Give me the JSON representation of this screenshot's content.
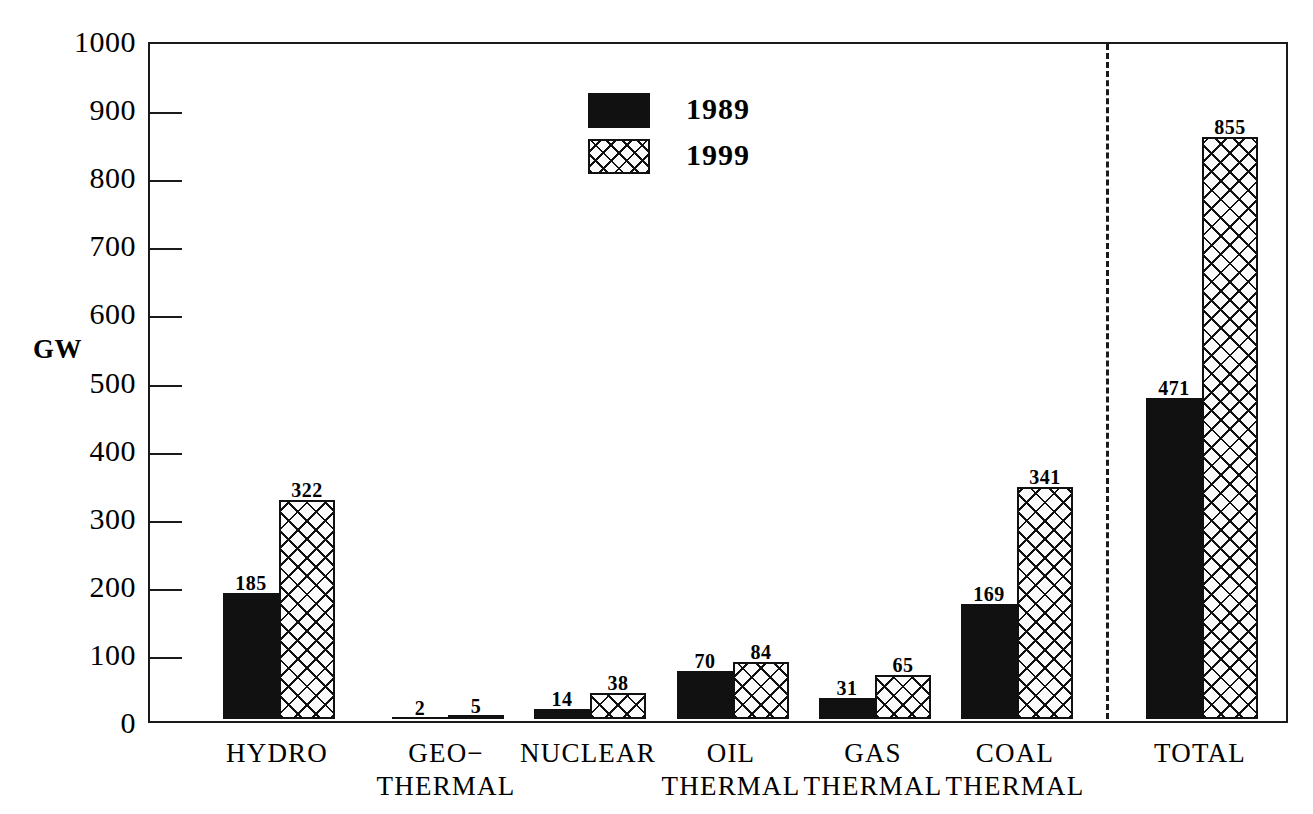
{
  "chart_data": {
    "type": "bar",
    "title": "",
    "xlabel": "",
    "ylabel": "GW",
    "ylim": [
      0,
      1000
    ],
    "ytick_values": [
      0,
      100,
      200,
      300,
      400,
      500,
      600,
      700,
      800,
      900,
      1000
    ],
    "ytick_labels": [
      "0",
      "100",
      "200",
      "300",
      "400",
      "500",
      "600",
      "700",
      "800",
      "900",
      "1000"
    ],
    "grid": false,
    "legend_position": "top-center",
    "categories": [
      "HYDRO",
      "GEO-\nTHERMAL",
      "NUCLEAR",
      "OIL\nTHERMAL",
      "GAS\nTHERMAL",
      "COAL\nTHERMAL",
      "TOTAL"
    ],
    "series": [
      {
        "name": "1989",
        "style": "solid-black",
        "values": [
          185,
          2,
          14,
          70,
          31,
          169,
          471
        ]
      },
      {
        "name": "1999",
        "style": "crosshatch",
        "values": [
          322,
          5,
          38,
          84,
          65,
          341,
          855
        ]
      }
    ],
    "annotations": {
      "separator": "dashed vertical line before TOTAL group"
    }
  },
  "axis": {
    "y_title": "GW",
    "ticks": [
      {
        "value": 1000,
        "label": "1000"
      },
      {
        "value": 900,
        "label": "900"
      },
      {
        "value": 800,
        "label": "800"
      },
      {
        "value": 700,
        "label": "700"
      },
      {
        "value": 600,
        "label": "600"
      },
      {
        "value": 500,
        "label": "500"
      },
      {
        "value": 400,
        "label": "400"
      },
      {
        "value": 300,
        "label": "300"
      },
      {
        "value": 200,
        "label": "200"
      },
      {
        "value": 100,
        "label": "100"
      },
      {
        "value": 0,
        "label": "0"
      }
    ]
  },
  "legend": {
    "entries": [
      {
        "label": "1989",
        "swatch": "solid-black"
      },
      {
        "label": "1999",
        "swatch": "crosshatch"
      }
    ]
  },
  "groups": [
    {
      "label_line1": "HYDRO",
      "label_line2": "",
      "bars": [
        {
          "series": "1989",
          "value": 185,
          "value_label": "185"
        },
        {
          "series": "1999",
          "value": 322,
          "value_label": "322"
        }
      ]
    },
    {
      "label_line1": "GEO−",
      "label_line2": "THERMAL",
      "bars": [
        {
          "series": "1989",
          "value": 2,
          "value_label": "2"
        },
        {
          "series": "1999",
          "value": 5,
          "value_label": "5"
        }
      ]
    },
    {
      "label_line1": "NUCLEAR",
      "label_line2": "",
      "bars": [
        {
          "series": "1989",
          "value": 14,
          "value_label": "14"
        },
        {
          "series": "1999",
          "value": 38,
          "value_label": "38"
        }
      ]
    },
    {
      "label_line1": "OIL",
      "label_line2": "THERMAL",
      "bars": [
        {
          "series": "1989",
          "value": 70,
          "value_label": "70"
        },
        {
          "series": "1999",
          "value": 84,
          "value_label": "84"
        }
      ]
    },
    {
      "label_line1": "GAS",
      "label_line2": "THERMAL",
      "bars": [
        {
          "series": "1989",
          "value": 31,
          "value_label": "31"
        },
        {
          "series": "1999",
          "value": 65,
          "value_label": "65"
        }
      ]
    },
    {
      "label_line1": "COAL",
      "label_line2": "THERMAL",
      "bars": [
        {
          "series": "1989",
          "value": 169,
          "value_label": "169"
        },
        {
          "series": "1999",
          "value": 341,
          "value_label": "341"
        }
      ]
    },
    {
      "label_line1": "TOTAL",
      "label_line2": "",
      "bars": [
        {
          "series": "1989",
          "value": 471,
          "value_label": "471"
        },
        {
          "series": "1999",
          "value": 855,
          "value_label": "855"
        }
      ]
    }
  ],
  "colors": {
    "ink": "#111111",
    "background": "#ffffff"
  },
  "layout": {
    "plot_left": 148,
    "plot_top": 42,
    "plot_width": 1140,
    "plot_height": 681,
    "baseline_y": 723,
    "separator_x": 1104,
    "group_centers": [
      277,
      446,
      588,
      731,
      873,
      1015,
      1200
    ],
    "bar_width": 56
  }
}
